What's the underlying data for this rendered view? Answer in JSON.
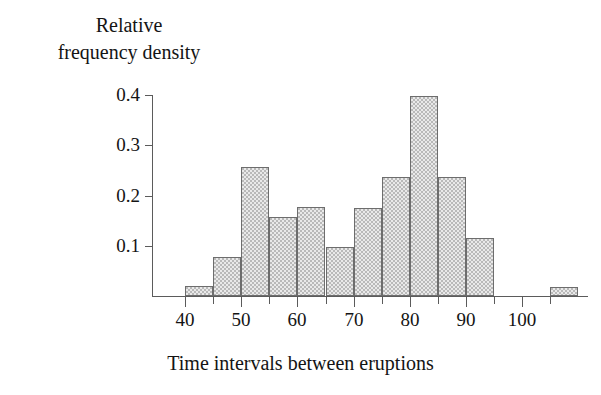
{
  "chart_data": {
    "type": "bar",
    "title": "",
    "subtitle": "",
    "xlabel": "Time intervals between eruptions",
    "ylabel": "Relative frequency density",
    "ylabel_lines": [
      "Relative",
      "frequency density"
    ],
    "xlim": [
      36,
      114
    ],
    "ylim": [
      0,
      0.43
    ],
    "grid": false,
    "legend": null,
    "bin_width": 5,
    "x_tick_labels": [
      "40",
      "50",
      "60",
      "70",
      "80",
      "90",
      "100"
    ],
    "x_tick_values": [
      40,
      50,
      60,
      70,
      80,
      90,
      100
    ],
    "x_minor_tick_values": [
      45,
      55,
      65,
      75,
      85,
      95,
      105
    ],
    "y_tick_labels": [
      "0.1",
      "0.2",
      "0.3",
      "0.4"
    ],
    "y_tick_values": [
      0.1,
      0.2,
      0.3,
      0.4
    ],
    "bin_edges": [
      40,
      45,
      50,
      55,
      60,
      65,
      70,
      75,
      80,
      85,
      90,
      95,
      105,
      110
    ],
    "bars": [
      {
        "bin_start": 40,
        "bin_end": 45,
        "value": 0.019
      },
      {
        "bin_start": 45,
        "bin_end": 50,
        "value": 0.078
      },
      {
        "bin_start": 50,
        "bin_end": 55,
        "value": 0.257
      },
      {
        "bin_start": 55,
        "bin_end": 60,
        "value": 0.157
      },
      {
        "bin_start": 60,
        "bin_end": 65,
        "value": 0.177
      },
      {
        "bin_start": 65,
        "bin_end": 70,
        "value": 0.098
      },
      {
        "bin_start": 70,
        "bin_end": 75,
        "value": 0.175
      },
      {
        "bin_start": 75,
        "bin_end": 80,
        "value": 0.236
      },
      {
        "bin_start": 80,
        "bin_end": 85,
        "value": 0.398
      },
      {
        "bin_start": 85,
        "bin_end": 90,
        "value": 0.236
      },
      {
        "bin_start": 90,
        "bin_end": 95,
        "value": 0.115
      },
      {
        "bin_start": 105,
        "bin_end": 110,
        "value": 0.017
      }
    ],
    "colors": {
      "bar_fill": "#e9e9e9",
      "bar_pattern": "#b9b9b9",
      "bar_border": "#6d6d6d",
      "axis": "#5b5b5b",
      "text": "#141414",
      "background": "#ffffff"
    }
  }
}
